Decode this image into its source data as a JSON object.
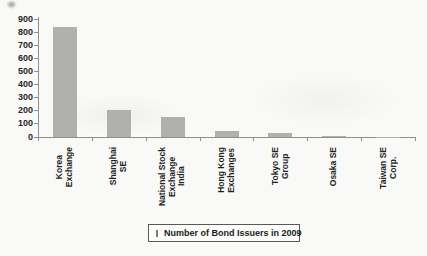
{
  "chart_data": {
    "type": "bar",
    "title": "",
    "categories": [
      "Korea Exchange",
      "Shanghai SE",
      "National Stock Exchange India",
      "Hong Kong Exchanges",
      "Tokyo SE Group",
      "Osaka SE",
      "Taiwan SE Corp."
    ],
    "category_label_lines": [
      [
        "Korea",
        "Exchange"
      ],
      [
        "Shanghai",
        "SE"
      ],
      [
        "National Stock",
        "Exchange",
        "India"
      ],
      [
        "Hong Kong",
        "Exchanges"
      ],
      [
        "Tokyo SE",
        "Group"
      ],
      [
        "Osaka SE"
      ],
      [
        "Taiwan SE",
        "Corp."
      ]
    ],
    "values": [
      845,
      210,
      150,
      45,
      30,
      8,
      2
    ],
    "yticks": [
      0,
      100,
      200,
      300,
      400,
      500,
      600,
      700,
      800,
      900
    ],
    "ylim": [
      0,
      900
    ],
    "grid": false,
    "legend": {
      "label": "Number of Bond Issuers in 2009",
      "position": "bottom"
    },
    "colors": {
      "bar": "#b0b0ae",
      "axis": "#8f8f8f",
      "text": "#1f1f1f"
    }
  }
}
